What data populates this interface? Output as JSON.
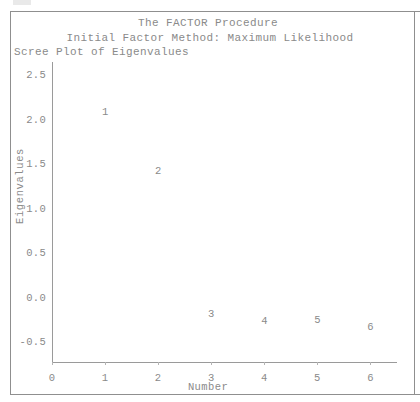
{
  "window": {
    "background_color": "#ffffff",
    "border_color": "#8f8f8f",
    "text_color": "#8a8a8a"
  },
  "header": {
    "title": "The FACTOR Procedure",
    "subtitle": "Initial Factor Method: Maximum Likelihood",
    "section_label": "Scree Plot of Eigenvalues"
  },
  "chart_data": {
    "type": "scatter",
    "title": "Scree Plot of Eigenvalues",
    "xlabel": "Number",
    "ylabel": "Eigenvalues",
    "x": [
      1,
      2,
      3,
      4,
      5,
      6
    ],
    "values": [
      2.08,
      1.41,
      -0.19,
      -0.27,
      -0.26,
      -0.34
    ],
    "point_labels": [
      "1",
      "2",
      "3",
      "4",
      "5",
      "6"
    ],
    "xlim": [
      0,
      6.5
    ],
    "ylim": [
      -0.72,
      2.65
    ],
    "xticks": [
      0,
      1,
      2,
      3,
      4,
      5,
      6
    ],
    "xtick_labels": [
      "0",
      "1",
      "2",
      "3",
      "4",
      "5",
      "6"
    ],
    "yticks": [
      2.5,
      2.0,
      1.5,
      1.0,
      0.5,
      0.0,
      -0.5
    ],
    "ytick_labels": [
      "2.5",
      "2.0",
      "1.5",
      "1.0",
      "0.5",
      "0.0",
      "-0.5"
    ],
    "grid": false,
    "legend": false,
    "marker": "text-label"
  }
}
